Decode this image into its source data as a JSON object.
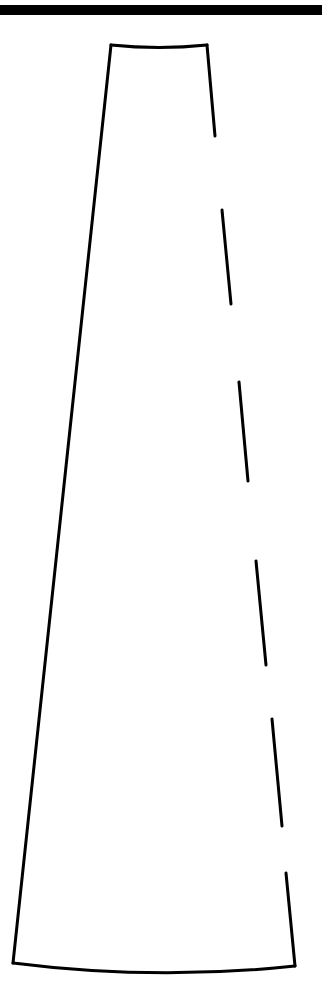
{
  "canvas": {
    "width": 322,
    "height": 1008,
    "background": "#ffffff"
  },
  "colors": {
    "stroke": "#000000",
    "rule": "#000000"
  },
  "top_rule": {
    "y": 5,
    "height": 10
  },
  "shape": {
    "description": "Tapered trapezoid outline with solid left edge, curved top and bottom edges, and dashed right edge",
    "stroke_width": 3,
    "top_edge": {
      "start": [
        111,
        45
      ],
      "control": [
        159,
        50
      ],
      "end": [
        207,
        45
      ]
    },
    "left_edge": {
      "start": [
        111,
        45
      ],
      "end": [
        13,
        963
      ]
    },
    "bottom_edge": {
      "start": [
        13,
        963
      ],
      "control": [
        154,
        981
      ],
      "end": [
        295,
        966
      ]
    },
    "right_edge_segments": [
      {
        "x1": 207,
        "y1": 45,
        "x2": 215,
        "y2": 136
      },
      {
        "x1": 222,
        "y1": 210,
        "x2": 231,
        "y2": 304
      },
      {
        "x1": 239,
        "y1": 382,
        "x2": 248,
        "y2": 481
      },
      {
        "x1": 256,
        "y1": 561,
        "x2": 266,
        "y2": 665
      },
      {
        "x1": 272,
        "y1": 719,
        "x2": 282,
        "y2": 826
      },
      {
        "x1": 286,
        "y1": 873,
        "x2": 295,
        "y2": 966
      }
    ]
  }
}
